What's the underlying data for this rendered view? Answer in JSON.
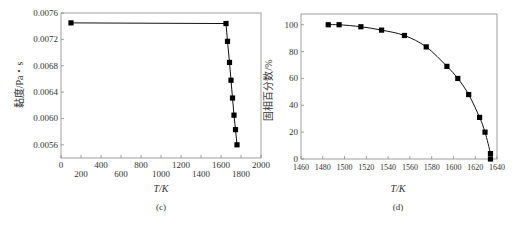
{
  "chart_data": [
    {
      "panel": "(c)",
      "type": "line",
      "title": "",
      "xlabel": "T/K",
      "ylabel": "黏度/Pa・s",
      "caption": "(c)",
      "xlim": [
        0,
        2000
      ],
      "ylim": [
        0.0054,
        0.0076
      ],
      "xticks": [
        0,
        200,
        400,
        600,
        800,
        1000,
        1200,
        1400,
        1600,
        1800,
        2000
      ],
      "xtick_labels": [
        "0",
        "200",
        "400",
        "600",
        "800",
        "1000",
        "1200",
        "1400",
        "1600",
        "1800",
        "2000"
      ],
      "yticks": [
        0.0056,
        0.006,
        0.0064,
        0.0068,
        0.0072,
        0.0076
      ],
      "ytick_labels": [
        "0.0056",
        "0.0060",
        "0.0064",
        "0.0068",
        "0.0072",
        "0.0076"
      ],
      "grid": false,
      "legend": null,
      "marker": "square",
      "series": [
        {
          "name": "viscosity",
          "x": [
            100,
            1650,
            1665,
            1685,
            1700,
            1715,
            1730,
            1745,
            1760
          ],
          "y": [
            0.00745,
            0.00744,
            0.00717,
            0.00685,
            0.00658,
            0.00631,
            0.00605,
            0.00583,
            0.0056
          ]
        }
      ]
    },
    {
      "panel": "(d)",
      "type": "line",
      "title": "",
      "xlabel": "T/K",
      "ylabel": "固相百分数/%",
      "caption": "(d)",
      "xlim": [
        1460,
        1640
      ],
      "ylim": [
        0,
        108
      ],
      "xticks": [
        1460,
        1480,
        1500,
        1520,
        1540,
        1560,
        1580,
        1600,
        1620,
        1640
      ],
      "xtick_labels": [
        "1460",
        "1480",
        "1500",
        "1520",
        "1540",
        "1560",
        "1580",
        "1600",
        "1620",
        "1640"
      ],
      "yticks": [
        0,
        20,
        40,
        60,
        80,
        100
      ],
      "ytick_labels": [
        "0",
        "20",
        "40",
        "60",
        "80",
        "100"
      ],
      "grid": false,
      "legend": null,
      "marker": "square",
      "series": [
        {
          "name": "solid fraction",
          "x": [
            1485,
            1495,
            1515,
            1534,
            1555,
            1575,
            1594,
            1604,
            1614,
            1624,
            1629,
            1634,
            1634
          ],
          "y": [
            100,
            100,
            98.5,
            96,
            92,
            83.5,
            69,
            60,
            48,
            31,
            20,
            4,
            0
          ]
        }
      ]
    }
  ]
}
